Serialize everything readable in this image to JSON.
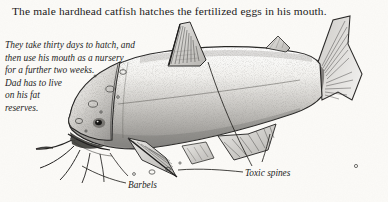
{
  "page": {
    "background_color": "#fbfaf7",
    "ink_color": "#1b1b1b",
    "width": 388,
    "height": 202
  },
  "title": {
    "text": "The male hardhead catfish hatches the fertilized eggs in his mouth."
  },
  "caption": {
    "lines": [
      "They take thirty days to hatch, and",
      "then use his mouth as a nursery",
      "for a further two weeks.",
      "Dad has to live",
      "on his fat",
      "reserves."
    ]
  },
  "labels": {
    "barbels": "Barbels",
    "toxic_spines": "Toxic spines"
  },
  "illustration": {
    "subject": "hardhead catfish pencil drawing, facing left",
    "parts": [
      "dorsal-fin",
      "adipose-fin",
      "caudal-fin",
      "pectoral-fin",
      "anal-fin",
      "head",
      "mouth",
      "eye",
      "barbels",
      "eggs-bubbles"
    ]
  }
}
